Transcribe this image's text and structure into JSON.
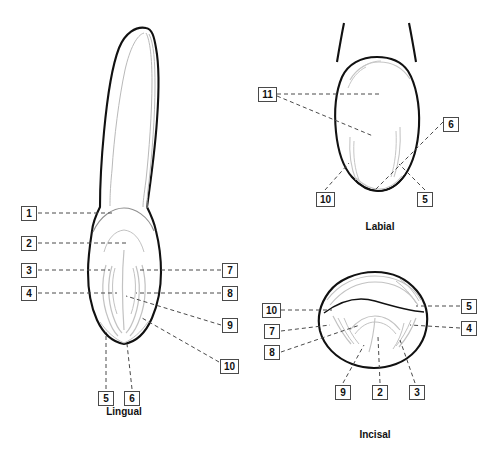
{
  "figure": {
    "background_color": "#ffffff",
    "outline_color": "#111111",
    "detail_color": "#b9b9b9",
    "leader_color": "#4a4a4a",
    "label_border_color": "#4a4a4a"
  },
  "views": [
    {
      "id": "lingual",
      "caption": "Lingual",
      "caption_x": 124,
      "caption_y": 406
    },
    {
      "id": "labial",
      "caption": "Labial",
      "caption_x": 380,
      "caption_y": 221
    },
    {
      "id": "incisal",
      "caption": "Incisal",
      "caption_x": 375,
      "caption_y": 429
    }
  ],
  "labels": [
    {
      "view": "lingual",
      "text": "1",
      "x": 21,
      "y": 206,
      "w": 1
    },
    {
      "view": "lingual",
      "text": "2",
      "x": 21,
      "y": 236,
      "w": 1
    },
    {
      "view": "lingual",
      "text": "3",
      "x": 21,
      "y": 263,
      "w": 1
    },
    {
      "view": "lingual",
      "text": "4",
      "x": 21,
      "y": 286,
      "w": 1
    },
    {
      "view": "lingual",
      "text": "7",
      "x": 222,
      "y": 263,
      "w": 1
    },
    {
      "view": "lingual",
      "text": "8",
      "x": 222,
      "y": 286,
      "w": 1
    },
    {
      "view": "lingual",
      "text": "9",
      "x": 222,
      "y": 318,
      "w": 1
    },
    {
      "view": "lingual",
      "text": "10",
      "x": 220,
      "y": 359,
      "w": 2
    },
    {
      "view": "lingual",
      "text": "5",
      "x": 98,
      "y": 391,
      "w": 1
    },
    {
      "view": "lingual",
      "text": "6",
      "x": 124,
      "y": 391,
      "w": 1
    },
    {
      "view": "labial",
      "text": "11",
      "x": 258,
      "y": 87,
      "w": 2
    },
    {
      "view": "labial",
      "text": "6",
      "x": 443,
      "y": 117,
      "w": 1
    },
    {
      "view": "labial",
      "text": "10",
      "x": 316,
      "y": 192,
      "w": 2
    },
    {
      "view": "labial",
      "text": "5",
      "x": 417,
      "y": 192,
      "w": 1
    },
    {
      "view": "incisal",
      "text": "10",
      "x": 262,
      "y": 303,
      "w": 2
    },
    {
      "view": "incisal",
      "text": "7",
      "x": 264,
      "y": 324,
      "w": 1
    },
    {
      "view": "incisal",
      "text": "8",
      "x": 264,
      "y": 345,
      "w": 1
    },
    {
      "view": "incisal",
      "text": "5",
      "x": 461,
      "y": 299,
      "w": 1
    },
    {
      "view": "incisal",
      "text": "4",
      "x": 461,
      "y": 321,
      "w": 1
    },
    {
      "view": "incisal",
      "text": "9",
      "x": 335,
      "y": 385,
      "w": 1
    },
    {
      "view": "incisal",
      "text": "2",
      "x": 372,
      "y": 385,
      "w": 1
    },
    {
      "view": "incisal",
      "text": "3",
      "x": 409,
      "y": 385,
      "w": 1
    }
  ]
}
